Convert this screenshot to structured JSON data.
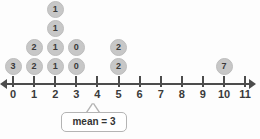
{
  "chart_data": {
    "type": "scatter",
    "title": "",
    "xlabel": "",
    "ylabel": "",
    "xlim": [
      0,
      11
    ],
    "grid": false,
    "legend": null,
    "tick_labels": [
      "0",
      "1",
      "2",
      "3",
      "4",
      "5",
      "6",
      "7",
      "8",
      "9",
      "10",
      "11"
    ],
    "dot_value_labels": true,
    "stacks": [
      {
        "x": 0,
        "count": 1,
        "labels": [
          "3"
        ]
      },
      {
        "x": 1,
        "count": 3,
        "labels": [
          "2",
          "2"
        ]
      },
      {
        "x": 2,
        "count": 4,
        "labels": [
          "1",
          "1",
          "1",
          "1"
        ]
      },
      {
        "x": 3,
        "count": 2,
        "labels": [
          "0",
          "0"
        ]
      },
      {
        "x": 5,
        "count": 2,
        "labels": [
          "2",
          "2"
        ]
      },
      {
        "x": 10,
        "count": 1,
        "labels": [
          "7"
        ]
      }
    ],
    "points": [
      {
        "x": 0,
        "stack_index": 0,
        "label": "3"
      },
      {
        "x": 1,
        "stack_index": 0,
        "label": "2"
      },
      {
        "x": 1,
        "stack_index": 1,
        "label": "2"
      },
      {
        "x": 2,
        "stack_index": 0,
        "label": "1"
      },
      {
        "x": 2,
        "stack_index": 1,
        "label": "1"
      },
      {
        "x": 2,
        "stack_index": 2,
        "label": "1"
      },
      {
        "x": 2,
        "stack_index": 3,
        "label": "1"
      },
      {
        "x": 3,
        "stack_index": 0,
        "label": "0"
      },
      {
        "x": 3,
        "stack_index": 1,
        "label": "0"
      },
      {
        "x": 5,
        "stack_index": 0,
        "label": "2"
      },
      {
        "x": 5,
        "stack_index": 1,
        "label": "2"
      },
      {
        "x": 10,
        "stack_index": 0,
        "label": "7"
      }
    ],
    "annotations": [
      {
        "name": "mean-callout",
        "text": "mean = 3",
        "points_to_x": 3
      }
    ],
    "colors": {
      "dot_fill": "#c7c7c7",
      "dot_stroke": "#bdbdbd",
      "dot_text": "#3a3a3a",
      "axis": "#4c4c4c",
      "tick_label": "#3a3a3a",
      "callout_bg": "#ffffff",
      "callout_border": "#b4b4b4",
      "background": "#fdfdfd"
    }
  },
  "mean_callout": {
    "text": "mean = 3"
  }
}
